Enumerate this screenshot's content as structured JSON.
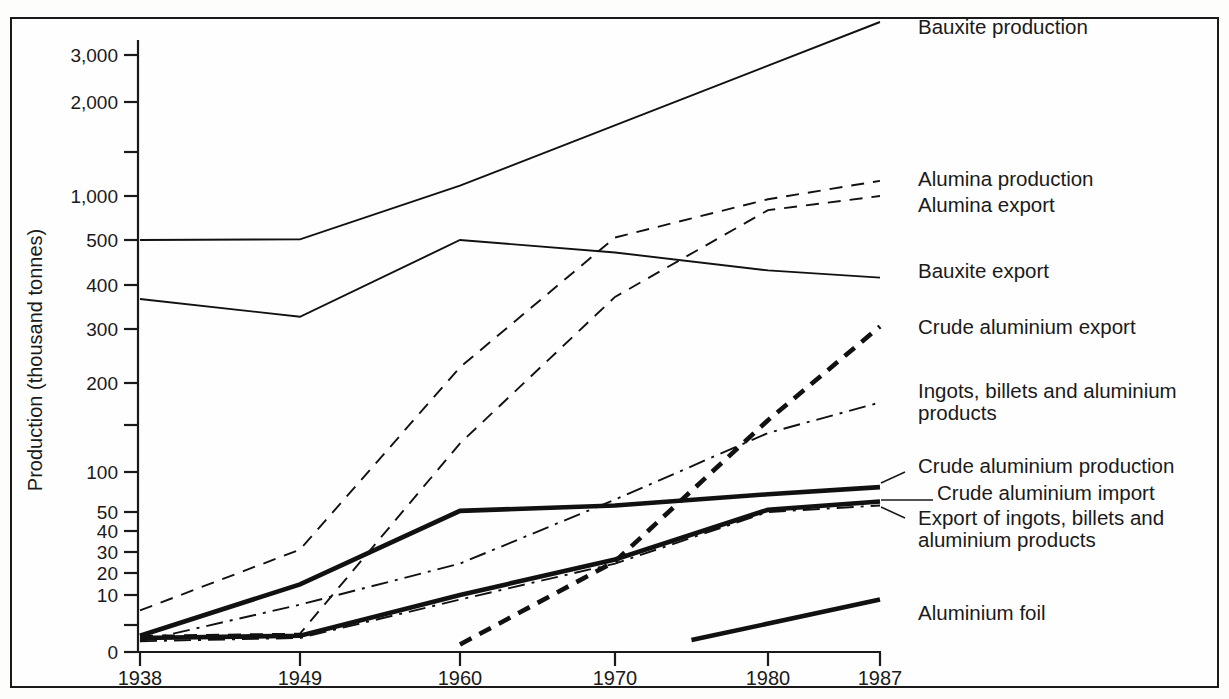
{
  "chart_data": {
    "type": "line",
    "title": "",
    "xlabel": "",
    "ylabel": "Production (thousand tonnes)",
    "x_categories": [
      "1938",
      "1949",
      "1960",
      "1970",
      "1980",
      "1987"
    ],
    "x_values": [
      1938,
      1949,
      1960,
      1970,
      1980,
      1987
    ],
    "y_tick_labels": [
      "0",
      "10",
      "20",
      "30",
      "40",
      "50",
      "100",
      "200",
      "300",
      "400",
      "500",
      "1,000",
      "2,000",
      "3,000"
    ],
    "y_tick_values": [
      0,
      10,
      20,
      30,
      40,
      50,
      100,
      200,
      300,
      400,
      500,
      1000,
      2000,
      3000
    ],
    "y_minor_ticks": [
      5,
      150,
      1500
    ],
    "yscale": "log-like (piecewise, zero-anchored)",
    "ylim": [
      0,
      3600
    ],
    "grid": false,
    "legend_position": "right, inline series labels",
    "series": [
      {
        "name": "Bauxite production",
        "style": "solid-thin",
        "x": [
          1938,
          1949,
          1960,
          1987
        ],
        "values": [
          500,
          505,
          1100,
          3600
        ],
        "label_x": 1987,
        "label_y": 3400
      },
      {
        "name": "Alumina production",
        "style": "dashed-thin",
        "x": [
          1938,
          1949,
          1960,
          1970,
          1980,
          1987
        ],
        "values": [
          7,
          31,
          225,
          520,
          950,
          1150
        ],
        "label_x": 1987,
        "label_y": 1060
      },
      {
        "name": "Alumina export",
        "style": "dashed-thin",
        "x": [
          1938,
          1949,
          1960,
          1970,
          1980,
          1987
        ],
        "values": [
          3,
          3.4,
          128,
          370,
          800,
          1000
        ],
        "label_x": 1987,
        "label_y": 880
      },
      {
        "name": "Bauxite export",
        "style": "solid-thin",
        "x": [
          1938,
          1949,
          1960,
          1970,
          1980,
          1987
        ],
        "values": [
          365,
          325,
          500,
          470,
          430,
          415
        ],
        "label_x": 1987,
        "label_y": 455
      },
      {
        "name": "Crude aluminium export",
        "style": "dashed-thick",
        "x": [
          1960,
          1970,
          1980,
          1987
        ],
        "values": [
          1.4,
          25,
          155,
          305
        ],
        "label_x": 1987,
        "label_y": 305
      },
      {
        "name": "Ingots, billets and aluminium products",
        "style": "dashdot-thin",
        "x": [
          1938,
          1949,
          1960,
          1970,
          1980,
          1987
        ],
        "values": [
          2,
          8,
          24,
          62,
          140,
          175
        ],
        "label_x": 1987,
        "label_y": 190
      },
      {
        "name": "Crude aluminium production",
        "style": "solid-thick",
        "x": [
          1938,
          1949,
          1960,
          1970,
          1980,
          1987
        ],
        "values": [
          3,
          14,
          51,
          56,
          68,
          77
        ],
        "label_x": 1987,
        "label_y": 103
      },
      {
        "name": "Crude aluminium import",
        "style": "solid-thick",
        "x": [
          1938,
          1949,
          1960,
          1970,
          1980,
          1987
        ],
        "values": [
          2.6,
          3,
          10,
          26,
          52,
          60
        ],
        "label_x": 1987,
        "label_y": 72
      },
      {
        "name": "Export of ingots, billets and aluminium products",
        "style": "dashdot-thin",
        "x": [
          1938,
          1949,
          1960,
          1970,
          1980,
          1987
        ],
        "values": [
          2,
          2.6,
          9,
          24,
          50,
          56
        ],
        "label_x": 1987,
        "label_y": 48
      },
      {
        "name": "Aluminium foil",
        "style": "solid-thick",
        "x": [
          1975,
          1987
        ],
        "values": [
          2.2,
          9
        ],
        "label_x": 1987,
        "label_y": 9
      }
    ],
    "labels_right": [
      {
        "text": "Bauxite production",
        "x": 918,
        "y": 34
      },
      {
        "text": "Alumina production",
        "x": 918,
        "y": 186
      },
      {
        "text": "Alumina export",
        "x": 918,
        "y": 212
      },
      {
        "text": "Bauxite export",
        "x": 918,
        "y": 278
      },
      {
        "text": "Crude aluminium export",
        "x": 918,
        "y": 334
      },
      {
        "text": "Ingots, billets and aluminium",
        "x": 918,
        "y": 398
      },
      {
        "text": "products",
        "x": 918,
        "y": 420
      },
      {
        "text": "Crude aluminium production",
        "x": 918,
        "y": 473
      },
      {
        "text": "Crude aluminium import",
        "x": 937,
        "y": 500
      },
      {
        "text": "Export of ingots, billets and",
        "x": 918,
        "y": 525
      },
      {
        "text": "aluminium products",
        "x": 918,
        "y": 547
      },
      {
        "text": "Aluminium foil",
        "x": 918,
        "y": 620
      }
    ]
  },
  "axes": {
    "y_axis_title": "Production (thousand tonnes)",
    "y_labels": [
      {
        "text": "3,000",
        "y": 55
      },
      {
        "text": "2,000",
        "y": 102
      },
      {
        "text": "1,000",
        "y": 196
      },
      {
        "text": "500",
        "y": 240
      },
      {
        "text": "400",
        "y": 285
      },
      {
        "text": "300",
        "y": 329
      },
      {
        "text": "200",
        "y": 383
      },
      {
        "text": "100",
        "y": 472
      },
      {
        "text": "50",
        "y": 512
      },
      {
        "text": "40",
        "y": 531
      },
      {
        "text": "30",
        "y": 552
      },
      {
        "text": "20",
        "y": 573
      },
      {
        "text": "10",
        "y": 595
      },
      {
        "text": "0",
        "y": 652
      }
    ],
    "y_minor_tick_y": [
      152,
      425,
      625
    ],
    "x_labels": [
      {
        "text": "1938",
        "x": 140
      },
      {
        "text": "1949",
        "x": 300
      },
      {
        "text": "1960",
        "x": 460
      },
      {
        "text": "1970",
        "x": 615
      },
      {
        "text": "1980",
        "x": 768
      },
      {
        "text": "1987",
        "x": 880
      }
    ]
  },
  "colors": {
    "line": "#111111",
    "frame": "#1a1a1a",
    "background": "#fefefe"
  }
}
